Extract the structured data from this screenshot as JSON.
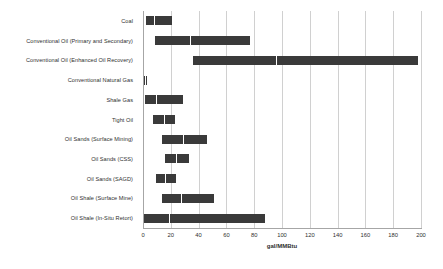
{
  "chart_data": {
    "type": "bar",
    "subtype": "range-bar",
    "title": "",
    "subtitle": "",
    "xlabel": "gal/MMBtu",
    "ylabel": "",
    "xlim": [
      0,
      200
    ],
    "xticks": [
      0,
      20,
      40,
      60,
      80,
      100,
      120,
      140,
      160,
      180,
      200
    ],
    "xtick_labels": [
      "0",
      "20",
      "40",
      "60",
      "80",
      "100",
      "120",
      "140",
      "160",
      "180",
      "200"
    ],
    "grid": true,
    "grid_axis": "x",
    "legend": false,
    "legend_position": "none",
    "bar_color": "#3a3a3a",
    "categories": [
      "Coal",
      "Conventional Oil (Primary and Secondary)",
      "Conventional Oil (Enhanced Oil Recovery)",
      "Conventional Natural Gas",
      "Shale Gas",
      "Tight Oil",
      "Oil Sands (Surface Mining)",
      "Oil Sands (CSS)",
      "Oil Sands (SAGD)",
      "Oil Shale (Surface Mine)",
      "Oil Shale (In-Situ Retort)"
    ],
    "ranges": [
      {
        "category": "Coal",
        "low": 2,
        "mid": 8,
        "high": 21
      },
      {
        "category": "Conventional Oil (Primary and Secondary)",
        "low": 8.5,
        "mid": 34,
        "high": 77
      },
      {
        "category": "Conventional Oil (Enhanced Oil Recovery)",
        "low": 36,
        "mid": 96,
        "high": 198
      },
      {
        "category": "Conventional Natural Gas",
        "low": 0.6,
        "mid": 1.6,
        "high": 3
      },
      {
        "category": "Shale Gas",
        "low": 1.5,
        "mid": 9,
        "high": 29
      },
      {
        "category": "Tight Oil",
        "low": 7,
        "mid": 15,
        "high": 23
      },
      {
        "category": "Oil Sands (Surface Mining)",
        "low": 14,
        "mid": 29,
        "high": 46
      },
      {
        "category": "Oil Sands (CSS)",
        "low": 16,
        "mid": 24,
        "high": 33
      },
      {
        "category": "Oil Sands (SAGD)",
        "low": 9,
        "mid": 16,
        "high": 24
      },
      {
        "category": "Oil Shale (Surface Mine)",
        "low": 14,
        "mid": 27,
        "high": 51
      },
      {
        "category": "Oil Shale (In-Situ Retort)",
        "low": 1,
        "mid": 19,
        "high": 88
      }
    ]
  }
}
